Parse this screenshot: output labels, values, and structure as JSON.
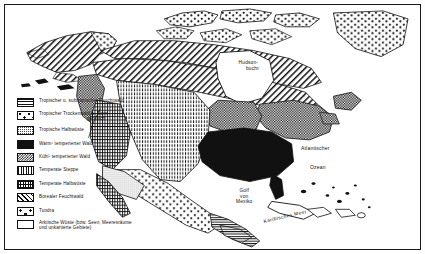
{
  "figure": {
    "frame_color": "#1a1a1a",
    "background": "#ffffff"
  },
  "legend": {
    "items": [
      {
        "pattern": "horizontal-lines",
        "label": "Tropischer u. subtropischer Feuchtwald"
      },
      {
        "pattern": "dot-cross",
        "label": "Tropischer Trockenwald u. Dorn-",
        "label2": "gebüsch"
      },
      {
        "pattern": "fine-stipple",
        "label": "Tropische Halbwüste"
      },
      {
        "pattern": "solid-black",
        "label": "Warm- temperierter Wald"
      },
      {
        "pattern": "dense-checker",
        "label": "Kühl- temperierter Wald"
      },
      {
        "pattern": "vertical-dashes",
        "label": "Temperate Steppe"
      },
      {
        "pattern": "dense-grid",
        "label": "Temperate Halbwüste"
      },
      {
        "pattern": "diagonal-hatch",
        "label": "Borealer Feuchtwald"
      },
      {
        "pattern": "sparse-dots",
        "label": "Tundra"
      },
      {
        "pattern": "white-empty",
        "label": "Arktische Wüste (bzw. Seen, Meeresräume",
        "label2": "und unkartierte Gebiete)"
      }
    ]
  },
  "map_labels": {
    "hudson_line1": "Hudson-",
    "hudson_line2": "bucht",
    "atlantic_line1": "Atlantischer",
    "atlantic_line2": "Ozean",
    "gulf": "Golf\nvon\nMexiko",
    "caribbean": "Karibisches Meer"
  }
}
